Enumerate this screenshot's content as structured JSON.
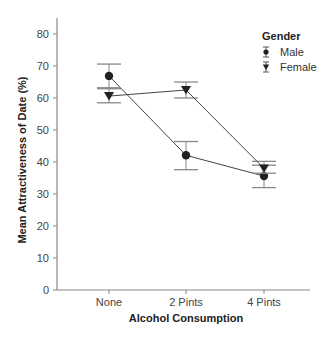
{
  "chart_data": {
    "type": "line",
    "title": "",
    "xlabel": "Alcohol Consumption",
    "ylabel": "Mean Attractiveness of Date (%)",
    "categories": [
      "None",
      "2 Pints",
      "4 Pints"
    ],
    "ylim": [
      0,
      85
    ],
    "yticks": [
      0,
      10,
      20,
      30,
      40,
      50,
      60,
      70,
      80
    ],
    "grid": false,
    "legend": {
      "title": "Gender",
      "position": "top-right"
    },
    "series": [
      {
        "name": "Male",
        "marker": "circle",
        "values": [
          66.9,
          42.1,
          35.6
        ],
        "error_low": [
          62.9,
          37.6,
          32.0
        ],
        "error_high": [
          70.6,
          46.4,
          39.0
        ]
      },
      {
        "name": "Female",
        "marker": "triangle-down",
        "values": [
          60.6,
          62.5,
          38.0
        ],
        "error_low": [
          58.5,
          60.0,
          36.5
        ],
        "error_high": [
          63.2,
          65.0,
          40.2
        ]
      }
    ]
  },
  "colors": {
    "axis": "#888888",
    "line": "#444444",
    "marker": "#222222",
    "errorbar": "#888888"
  }
}
